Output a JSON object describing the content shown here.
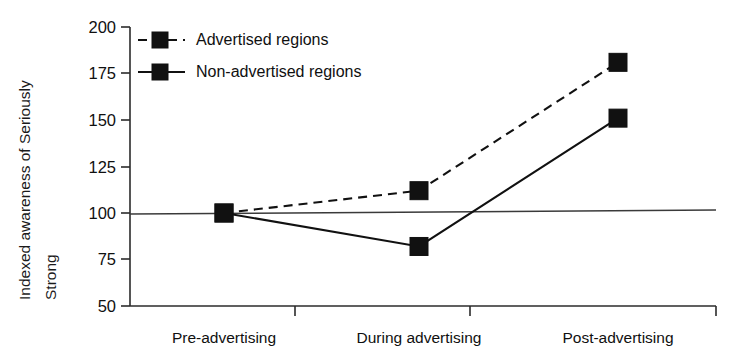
{
  "chart_data": {
    "type": "line",
    "title": "",
    "xlabel": "",
    "ylabel": "Indexed awareness of Seriously Strong",
    "ylabel_lines": [
      "Indexed awareness of Seriously",
      "Strong"
    ],
    "categories": [
      "Pre-advertising",
      "During advertising",
      "Post-advertising"
    ],
    "yticks": [
      50,
      75,
      100,
      125,
      150,
      175,
      200
    ],
    "ytick_labels": [
      "50",
      "75",
      "100",
      "125",
      "150",
      "175",
      "200"
    ],
    "ylim": [
      50,
      200
    ],
    "grid": false,
    "legend_position": "top-left inside",
    "reference_line": {
      "label": "",
      "value": 100,
      "style": "solid"
    },
    "series": [
      {
        "name": "Advertised regions",
        "style": "dashed",
        "marker": "square",
        "color": "#111111",
        "values": [
          100,
          112,
          181
        ]
      },
      {
        "name": "Non-advertised regions",
        "style": "solid",
        "marker": "square",
        "color": "#111111",
        "values": [
          100,
          82,
          151
        ]
      }
    ]
  },
  "legend": {
    "items": [
      {
        "label": "Advertised regions",
        "style": "dashed"
      },
      {
        "label": "Non-advertised regions",
        "style": "solid"
      }
    ]
  },
  "axes": {
    "y_label_line1": "Indexed awareness of Seriously",
    "y_label_line2": "Strong",
    "y_tick_200": "200",
    "y_tick_175": "175",
    "y_tick_150": "150",
    "y_tick_125": "125",
    "y_tick_100": "100",
    "y_tick_75": "75",
    "y_tick_50": "50",
    "x_cat_1": "Pre-advertising",
    "x_cat_2": "During advertising",
    "x_cat_3": "Post-advertising"
  }
}
